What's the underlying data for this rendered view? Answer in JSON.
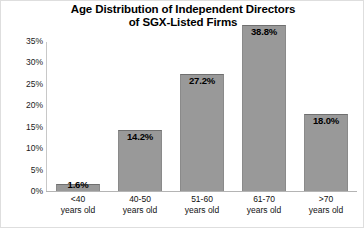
{
  "chart_data": {
    "type": "bar",
    "title": "Age Distribution of Independent Directors of SGX-Listed Firms",
    "title_lines": [
      "Age Distribution of Independent Directors",
      "of SGX-Listed Firms"
    ],
    "categories": [
      "<40 years old",
      "40-50 years old",
      "51-60 years old",
      "61-70 years old",
      ">70 years old"
    ],
    "category_lines": [
      [
        "<40",
        "years old"
      ],
      [
        "40-50",
        "years old"
      ],
      [
        "51-60",
        "years old"
      ],
      [
        "61-70",
        "years old"
      ],
      [
        ">70",
        "years old"
      ]
    ],
    "values": [
      1.6,
      14.2,
      27.2,
      38.8,
      18.0
    ],
    "data_labels": [
      "1.6%",
      "14.2%",
      "27.2%",
      "38.8%",
      "18.0%"
    ],
    "xlabel": "",
    "ylabel": "",
    "ylim": [
      0,
      35
    ],
    "ytick_values": [
      0,
      5,
      10,
      15,
      20,
      25,
      30,
      35
    ],
    "ytick_labels": [
      "0%",
      "5%",
      "10%",
      "15%",
      "20%",
      "25%",
      "30%",
      "35%"
    ],
    "grid": false,
    "legend": false,
    "bar_color": "#999999",
    "bar_border_color": "#6f6f6f",
    "axis_color": "#c8c8c8",
    "text_color": "#000000"
  }
}
